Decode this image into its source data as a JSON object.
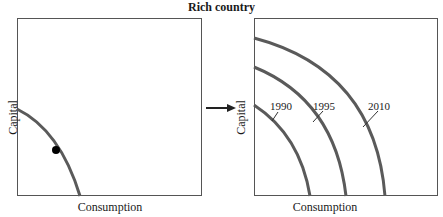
{
  "title": "Rich country",
  "left_panel": {
    "xlabel": "Consumption",
    "ylabel": "Capital"
  },
  "right_panel": {
    "xlabel": "Consumption",
    "ylabel": "Capital",
    "curves": [
      {
        "label": "1990"
      },
      {
        "label": "1995"
      },
      {
        "label": "2010"
      }
    ]
  },
  "colors": {
    "curve": "#5a5a5a",
    "point": "#000000",
    "frame": "#555555"
  }
}
